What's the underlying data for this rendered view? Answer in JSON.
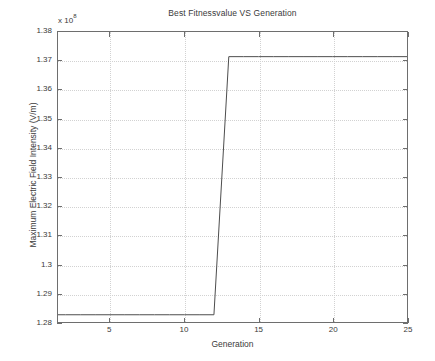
{
  "chart_data": {
    "type": "line",
    "title": "Best Fitnessvalue VS Generation",
    "xlabel": "Generation",
    "ylabel": "Maximum Electric Field Intensity (V/m)",
    "y_multiplier_prefix": "x 10",
    "y_multiplier_exponent": "8",
    "xlim": [
      1.5,
      25
    ],
    "ylim": [
      1.28,
      1.38
    ],
    "xticks": [
      5,
      10,
      15,
      20,
      25
    ],
    "xtick_labels": [
      "5",
      "10",
      "15",
      "20",
      "25"
    ],
    "yticks": [
      1.28,
      1.29,
      1.3,
      1.31,
      1.32,
      1.33,
      1.34,
      1.35,
      1.36,
      1.37,
      1.38
    ],
    "ytick_labels": [
      "1.28",
      "1.29",
      "1.3",
      "1.31",
      "1.32",
      "1.33",
      "1.34",
      "1.35",
      "1.36",
      "1.37",
      "1.38"
    ],
    "grid": true,
    "legend": null,
    "series": [
      {
        "name": "Best fitness value",
        "color": "#4d4d4d",
        "x": [
          1.5,
          2,
          3,
          4,
          5,
          6,
          7,
          8,
          9,
          10,
          11,
          12,
          13,
          14,
          15,
          16,
          17,
          18,
          19,
          20,
          21,
          22,
          23,
          24,
          25
        ],
        "y": [
          1.2825,
          1.2825,
          1.2825,
          1.2825,
          1.2825,
          1.2825,
          1.2825,
          1.2825,
          1.2825,
          1.2825,
          1.2825,
          1.2825,
          1.3715,
          1.3715,
          1.3715,
          1.3715,
          1.3715,
          1.3715,
          1.3715,
          1.3715,
          1.3715,
          1.3715,
          1.3715,
          1.3715,
          1.3715
        ]
      }
    ],
    "annotations": [
      "Step improvement between generation 12 and 13",
      "Low plateau value approximately 1.2825e8 V/m",
      "High plateau value approximately 1.3715e8 V/m"
    ]
  }
}
